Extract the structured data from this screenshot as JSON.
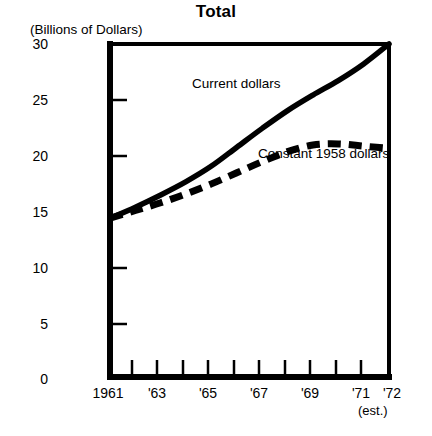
{
  "chart_data": {
    "type": "line",
    "title": "Total",
    "ylabel": "(Billions of Dollars)",
    "xlabel": "",
    "ylim": [
      0,
      30
    ],
    "xlim": [
      1961,
      1972
    ],
    "grid": false,
    "legend_position": "inline-annotations",
    "footnote": "GNP price deflator was used to convert current to constant dollars.",
    "est_note": "(est.)",
    "y_ticks": [
      0,
      5,
      10,
      15,
      20,
      25,
      30
    ],
    "y_tick_labels": [
      "0",
      "5",
      "10",
      "15",
      "20",
      "25",
      "30"
    ],
    "x_ticks": [
      1961,
      1962,
      1963,
      1964,
      1965,
      1966,
      1967,
      1968,
      1969,
      1970,
      1971,
      1972
    ],
    "x_tick_labels": [
      "1961",
      "",
      "'63",
      "",
      "'65",
      "",
      "'67",
      "",
      "'69",
      "",
      "'71",
      "'72"
    ],
    "x": [
      1961,
      1962,
      1963,
      1964,
      1965,
      1966,
      1967,
      1968,
      1969,
      1970,
      1971,
      1972
    ],
    "series": [
      {
        "name": "Current dollars",
        "style": "solid",
        "color": "#000000",
        "values": [
          14.3,
          15.3,
          16.4,
          17.6,
          19.0,
          20.7,
          22.4,
          24.0,
          25.4,
          26.7,
          28.2,
          30.0
        ]
      },
      {
        "name": "Constant 1958 dollars",
        "style": "dashed",
        "color": "#000000",
        "values": [
          14.3,
          15.0,
          15.7,
          16.5,
          17.4,
          18.4,
          19.4,
          20.3,
          20.9,
          21.0,
          20.8,
          20.6
        ]
      }
    ]
  },
  "axes": {
    "y_unit_label": "(Billions of Dollars)",
    "y_labels": [
      "30",
      "25",
      "20",
      "15",
      "10",
      "5",
      "0"
    ],
    "x_labels": [
      "1961",
      "'63",
      "'65",
      "'67",
      "'69",
      "'71",
      "'72"
    ]
  },
  "annotations": {
    "current_dollars": "Current dollars",
    "constant_dollars": "Constant 1958 dollars"
  },
  "title": "Total",
  "footnote": "GNP price deflator was used to convert current to constant dollars.",
  "est_note": "(est.)",
  "colors": {
    "ink": "#000000",
    "background": "#ffffff"
  }
}
